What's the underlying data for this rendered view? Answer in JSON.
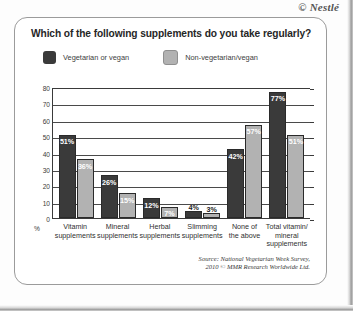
{
  "watermark": "© Nestlé",
  "panel": {
    "title": "Which of the following supplements do you take regularly?",
    "source_line1": "Source: National Vegetarian Week Survey,",
    "source_line2": "2010 © MMR Research Worldwide Ltd."
  },
  "colors": {
    "series_dark": "#3a3a3a",
    "series_light": "#b2b2b2",
    "axis": "#3a3a3a",
    "panel_border": "#9b9b9b"
  },
  "chart_data": {
    "type": "bar",
    "title": "Which of the following supplements do you take regularly?",
    "xlabel": "",
    "ylabel": "%",
    "ylim": [
      0,
      80
    ],
    "yticks": [
      0,
      10,
      20,
      30,
      40,
      50,
      60,
      70,
      80
    ],
    "ytick_labels": [
      "0",
      "10",
      "20",
      "30",
      "40",
      "50",
      "60",
      "70",
      "80"
    ],
    "grid": true,
    "grid_axis": "y",
    "legend_position": "top-left",
    "categories": [
      "Vitamin supplements",
      "Mineral supplements",
      "Herbal supplements",
      "Slimming supplements",
      "None of the above",
      "Total vitamin/ mineral supplements"
    ],
    "category_lines": [
      [
        "Vitamin",
        "supplements"
      ],
      [
        "Mineral",
        "supplements"
      ],
      [
        "Herbal",
        "supplements"
      ],
      [
        "Slimming",
        "supplements"
      ],
      [
        "None of",
        "the above"
      ],
      [
        "Total vitamin/",
        "mineral",
        "supplements"
      ]
    ],
    "series": [
      {
        "name": "Vegetarian or vegan",
        "color": "#3a3a3a",
        "values": [
          51,
          26,
          12,
          4,
          42,
          77
        ],
        "data_labels": [
          "51%",
          "26%",
          "12%",
          "4%",
          "42%",
          "77%"
        ],
        "label_placement": [
          "inside",
          "inside",
          "inside",
          "outside",
          "inside",
          "inside"
        ]
      },
      {
        "name": "Non-vegetarian/vegan",
        "color": "#b2b2b2",
        "values": [
          36,
          15,
          7,
          3,
          57,
          51
        ],
        "data_labels": [
          "36%",
          "15%",
          "7%",
          "3%",
          "57%",
          "51%"
        ],
        "label_placement": [
          "inside",
          "inside",
          "inside",
          "outside",
          "inside",
          "inside"
        ]
      }
    ],
    "source": "Source: National Vegetarian Week Survey, 2010 © MMR Research Worldwide Ltd."
  }
}
